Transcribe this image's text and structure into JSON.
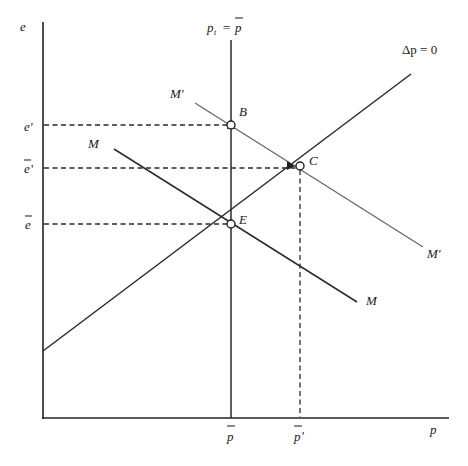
{
  "diagram": {
    "type": "economics-phase-diagram",
    "axes": {
      "y_label": "e",
      "x_label": "p"
    },
    "y_ticks": [
      {
        "label": "e",
        "prime": "'",
        "bar": false,
        "y": 125
      },
      {
        "label": "e",
        "prime": "'",
        "bar": true,
        "y": 168
      },
      {
        "label": "e",
        "prime": "",
        "bar": true,
        "y": 224
      }
    ],
    "x_ticks": [
      {
        "label": "p",
        "prime": "",
        "bar": true,
        "x": 231
      },
      {
        "label": "p",
        "prime": "'",
        "bar": true,
        "x": 300
      }
    ],
    "curves": {
      "vertical": {
        "label_lhs": "p",
        "label_sub": "t",
        "label_eq": " = ",
        "label_rhs": "p"
      },
      "delta_p": {
        "label": "Δp = 0"
      },
      "M": {
        "label": "M"
      },
      "M_prime": {
        "label": "M'"
      }
    },
    "points": [
      {
        "name": "B",
        "x": 231,
        "y": 125
      },
      {
        "name": "C",
        "x": 300,
        "y": 166
      },
      {
        "name": "E",
        "x": 231,
        "y": 224
      }
    ]
  },
  "text": {
    "e_axis": "e",
    "p_axis": "p",
    "e_prime": "e'",
    "ebar_prime_base": "e",
    "ebar_prime_mark": "'",
    "ebar": "e",
    "pbar": "p",
    "pbar_prime_base": "p",
    "pbar_prime_mark": "'",
    "pt_p": "p",
    "pt_sub": "t",
    "pt_eq": "=",
    "pt_rhs": "p",
    "delta_p": "Δp = 0",
    "M_left": "M",
    "M_right": "M",
    "Mp_left": "M'",
    "Mp_right": "M'",
    "B": "B",
    "C": "C",
    "E": "E"
  }
}
